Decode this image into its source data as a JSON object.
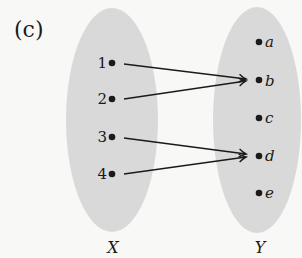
{
  "panel_label": "(c)",
  "colors": {
    "background": "#f8f8f6",
    "set_fill": "#d9d9d9",
    "ink": "#1a1a1a"
  },
  "sets": {
    "domain": {
      "label": "X",
      "elements": [
        "1",
        "2",
        "3",
        "4"
      ]
    },
    "codomain": {
      "label": "Y",
      "elements": [
        "a",
        "b",
        "c",
        "d",
        "e"
      ]
    }
  },
  "mapping": [
    {
      "from": "1",
      "to": "b"
    },
    {
      "from": "2",
      "to": "b"
    },
    {
      "from": "3",
      "to": "d"
    },
    {
      "from": "4",
      "to": "d"
    }
  ]
}
